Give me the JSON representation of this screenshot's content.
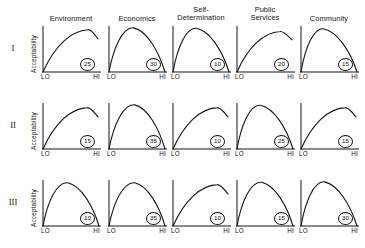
{
  "figure": {
    "row_labels": [
      "I",
      "II",
      "III"
    ],
    "y_axis_label": "Acceptability",
    "x_tick_low": "LO",
    "x_tick_high": "HI",
    "column_headers": [
      "Environment",
      "Economics",
      "Self-\nDetermination",
      "Public\nServices",
      "Community"
    ]
  },
  "chart_data": {
    "type": "line",
    "title": "",
    "xlabel": "",
    "ylabel": "Acceptability",
    "x_tick_labels": [
      "LO",
      "HI"
    ],
    "xlim": [
      0,
      1
    ],
    "ylim": [
      0,
      1
    ],
    "grid": false,
    "legend": "none",
    "layout": {
      "rows": 3,
      "cols": 5
    },
    "row_names": [
      "I",
      "II",
      "III"
    ],
    "col_names": [
      "Environment",
      "Economics",
      "Self-Determination",
      "Public Services",
      "Community"
    ],
    "panels": [
      {
        "row": "I",
        "col": "Environment",
        "annotation": "25",
        "shape": "rising-truncated",
        "peak_x": 0.82,
        "peak_y": 0.92,
        "end_y": 0.72
      },
      {
        "row": "I",
        "col": "Economics",
        "annotation": "30",
        "shape": "arch",
        "peak_x": 0.44,
        "peak_y": 0.96,
        "end_y": 0.0
      },
      {
        "row": "I",
        "col": "Self-Determination",
        "annotation": "10",
        "shape": "arch",
        "peak_x": 0.42,
        "peak_y": 0.95,
        "end_y": 0.0
      },
      {
        "row": "I",
        "col": "Public Services",
        "annotation": "20",
        "shape": "rising-truncated",
        "peak_x": 0.78,
        "peak_y": 0.88,
        "end_y": 0.7
      },
      {
        "row": "I",
        "col": "Community",
        "annotation": "15",
        "shape": "arch",
        "peak_x": 0.4,
        "peak_y": 0.94,
        "end_y": 0.0
      },
      {
        "row": "II",
        "col": "Environment",
        "annotation": "15",
        "shape": "rising-truncated",
        "peak_x": 0.8,
        "peak_y": 0.9,
        "end_y": 0.7
      },
      {
        "row": "II",
        "col": "Economics",
        "annotation": "35",
        "shape": "arch",
        "peak_x": 0.46,
        "peak_y": 0.96,
        "end_y": 0.0
      },
      {
        "row": "II",
        "col": "Self-Determination",
        "annotation": "10",
        "shape": "rising-truncated",
        "peak_x": 0.8,
        "peak_y": 0.9,
        "end_y": 0.7
      },
      {
        "row": "II",
        "col": "Public Services",
        "annotation": "25",
        "shape": "arch",
        "peak_x": 0.42,
        "peak_y": 0.95,
        "end_y": 0.0
      },
      {
        "row": "II",
        "col": "Community",
        "annotation": "15",
        "shape": "rising-truncated",
        "peak_x": 0.8,
        "peak_y": 0.9,
        "end_y": 0.7
      },
      {
        "row": "III",
        "col": "Environment",
        "annotation": "10",
        "shape": "arch",
        "peak_x": 0.44,
        "peak_y": 0.94,
        "end_y": 0.0
      },
      {
        "row": "III",
        "col": "Economics",
        "annotation": "35",
        "shape": "arch",
        "peak_x": 0.46,
        "peak_y": 0.94,
        "end_y": 0.0
      },
      {
        "row": "III",
        "col": "Self-Determination",
        "annotation": "10",
        "shape": "rising-truncated",
        "peak_x": 0.8,
        "peak_y": 0.9,
        "end_y": 0.7
      },
      {
        "row": "III",
        "col": "Public Services",
        "annotation": "15",
        "shape": "arch",
        "peak_x": 0.44,
        "peak_y": 0.95,
        "end_y": 0.0
      },
      {
        "row": "III",
        "col": "Community",
        "annotation": "30",
        "shape": "arch",
        "peak_x": 0.42,
        "peak_y": 0.96,
        "end_y": 0.0
      }
    ]
  }
}
